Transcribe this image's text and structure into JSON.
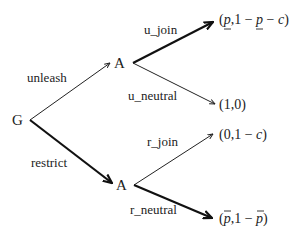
{
  "diagram": {
    "type": "game-tree",
    "nodes": {
      "root": {
        "label": "G"
      },
      "upper": {
        "label": "A"
      },
      "lower": {
        "label": "A"
      }
    },
    "edges": {
      "unleash": {
        "label": "unleash",
        "bold": false
      },
      "restrict": {
        "label": "restrict",
        "bold": true
      },
      "u_join": {
        "label": "u_join",
        "bold": true
      },
      "u_neutral": {
        "label": "u_neutral",
        "bold": false
      },
      "r_join": {
        "label": "r_join",
        "bold": false
      },
      "r_neutral": {
        "label": "r_neutral",
        "bold": true
      }
    },
    "payoffs": {
      "u_join": {
        "open": "(",
        "p1": "p",
        "comma": ",",
        "one_minus": "1 − ",
        "p2": "p",
        "minus_c": " − ",
        "c": "c",
        "close": ")",
        "text": "(p̲, 1 − p̲ − c)"
      },
      "u_neutral": {
        "text": "(1,0)"
      },
      "r_join": {
        "open": "(0,1 − ",
        "c": "c",
        "close": ")",
        "text": "(0, 1 − c)"
      },
      "r_neutral": {
        "open": "(",
        "p1": "p",
        "comma": ",1 − ",
        "p2": "p",
        "close": ")",
        "text": "(p̄, 1 − p̄)"
      }
    },
    "colors": {
      "ink": "#222222",
      "background": "#ffffff"
    }
  }
}
